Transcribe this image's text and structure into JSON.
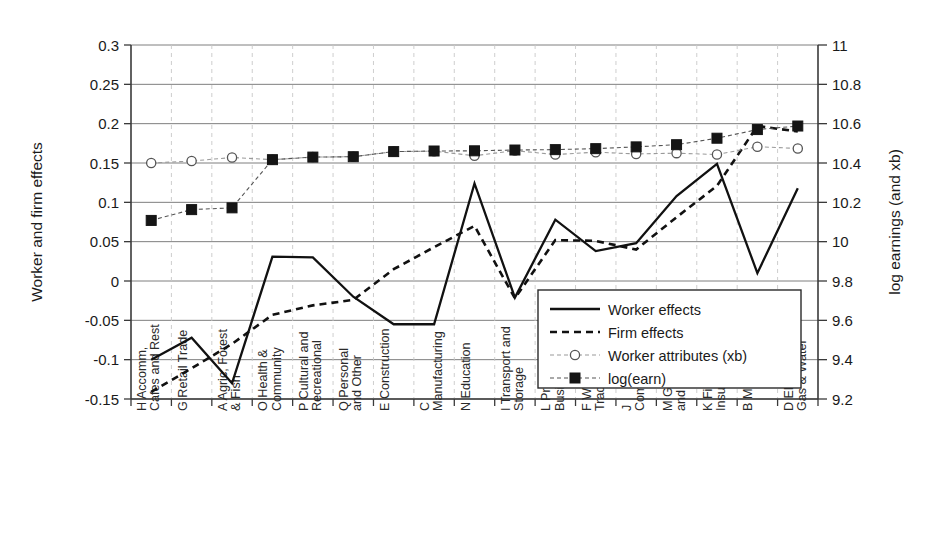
{
  "chart_data": {
    "type": "line",
    "title": "",
    "xlabel": "",
    "ylabel": "Worker and firm effects",
    "y2label": "log earnings (and xb)",
    "ylim": [
      -0.15,
      0.3
    ],
    "y2lim": [
      9.2,
      11
    ],
    "yticks": [
      "-0.15",
      "-0.1",
      "-0.05",
      "0",
      "0.05",
      "0.1",
      "0.15",
      "0.2",
      "0.25",
      "0.3"
    ],
    "ytick_values": [
      -0.15,
      -0.1,
      -0.05,
      0,
      0.05,
      0.1,
      0.15,
      0.2,
      0.25,
      0.3
    ],
    "y2ticks": [
      "9.2",
      "9.4",
      "9.6",
      "9.8",
      "10",
      "10.2",
      "10.4",
      "10.6",
      "10.8",
      "11"
    ],
    "y2tick_values": [
      9.2,
      9.4,
      9.6,
      9.8,
      10,
      10.2,
      10.4,
      10.6,
      10.8,
      11
    ],
    "grid": "both",
    "legend_position": "inside-lower-right",
    "categories": [
      "H Accomm, Cafes and Rest",
      "G Retail Trade",
      "A Agric, Forest & Fish",
      "O Health & Community",
      "P Cultural and Recreational",
      "Q Personal and Other",
      "E Construction",
      "C Manufacturing",
      "N Education",
      "I Transport and Storage",
      "L Property and Business Serv",
      "F Wholesale Trade",
      "J Communication",
      "M Govt Admin and Defence",
      "K Finance and Insurance",
      "B Mining",
      "D Electricity, Gas & Water"
    ],
    "category_lines": [
      [
        "H Accomm,",
        "Cafes and Rest"
      ],
      [
        "G Retail Trade"
      ],
      [
        "A Agric, Forest",
        "& Fish"
      ],
      [
        "O Health &",
        "Community"
      ],
      [
        "P Cultural and",
        "Recreational"
      ],
      [
        "Q Personal",
        "and Other"
      ],
      [
        "E Construction"
      ],
      [
        "C",
        "Manufacturing"
      ],
      [
        "N Education"
      ],
      [
        "I Transport and",
        "Storage"
      ],
      [
        "L Property and",
        "Business Serv"
      ],
      [
        "F Wholesale",
        "Trade"
      ],
      [
        "J",
        "Communication"
      ],
      [
        "M Govt Admin",
        "and Defence"
      ],
      [
        "K Finance and",
        "Insurance"
      ],
      [
        "B Mining"
      ],
      [
        "D Electricity,",
        "Gas & Water"
      ]
    ],
    "series": [
      {
        "name": "Worker effects",
        "axis": "left",
        "style": "solid",
        "marker": "none",
        "color": "#111111",
        "values": [
          -0.1,
          -0.072,
          -0.13,
          0.031,
          0.03,
          -0.02,
          -0.055,
          -0.055,
          0.124,
          -0.021,
          0.078,
          0.038,
          0.048,
          0.108,
          0.149,
          0.01,
          0.118
        ]
      },
      {
        "name": "Firm effects",
        "axis": "left",
        "style": "dashed",
        "marker": "none",
        "color": "#111111",
        "values": [
          -0.141,
          -0.111,
          -0.08,
          -0.043,
          -0.031,
          -0.024,
          0.015,
          0.043,
          0.07,
          -0.022,
          0.052,
          0.051,
          0.04,
          0.081,
          0.121,
          0.197,
          0.19
        ]
      },
      {
        "name": "Worker attributes (xb)",
        "axis": "right",
        "style": "dotted",
        "marker": "circle",
        "color": "#9a9a9a",
        "values": [
          10.4,
          10.41,
          10.428,
          10.417,
          10.43,
          10.432,
          10.458,
          10.46,
          10.437,
          10.463,
          10.443,
          10.455,
          10.446,
          10.45,
          10.443,
          10.483,
          10.474
        ]
      },
      {
        "name": "log(earn)",
        "axis": "right",
        "style": "dotted",
        "marker": "square",
        "color": "#151515",
        "values": [
          10.108,
          10.163,
          10.172,
          10.417,
          10.43,
          10.432,
          10.458,
          10.461,
          10.462,
          10.466,
          10.468,
          10.473,
          10.482,
          10.493,
          10.526,
          10.57,
          10.588
        ]
      }
    ]
  },
  "legend": {
    "items": [
      {
        "label": "Worker effects",
        "kind": "solid"
      },
      {
        "label": "Firm effects",
        "kind": "dashed"
      },
      {
        "label": "Worker attributes (xb)",
        "kind": "circle"
      },
      {
        "label": "log(earn)",
        "kind": "square"
      }
    ]
  }
}
